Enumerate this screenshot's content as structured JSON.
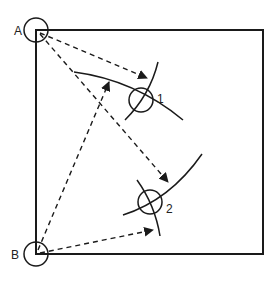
{
  "diagram": {
    "stations": [
      {
        "id": "A",
        "label": "A"
      },
      {
        "id": "B",
        "label": "B"
      }
    ],
    "points": [
      {
        "id": "1",
        "label": "1"
      },
      {
        "id": "2",
        "label": "2"
      }
    ],
    "colors": {
      "stroke": "#1a1a1a",
      "background": "#ffffff"
    }
  }
}
